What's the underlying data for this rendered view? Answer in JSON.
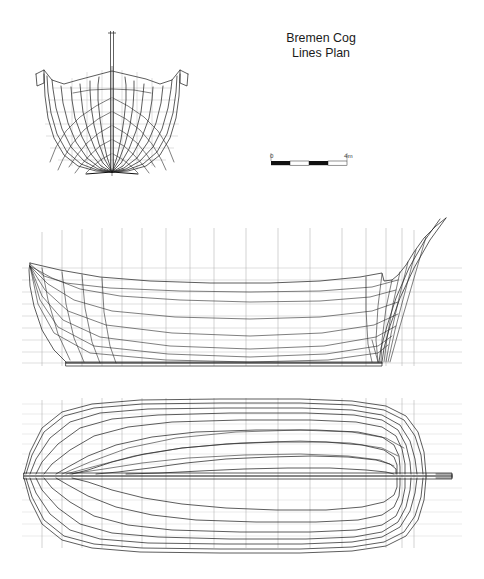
{
  "document": {
    "title_line1": "Bremen Cog",
    "title_line2": "Lines Plan",
    "background_color": "#ffffff",
    "ink_color": "#1d1d1d",
    "grid_color": "#b9b9b9"
  },
  "scale_bar": {
    "label_start": "0",
    "label_end": "4m",
    "segments": 4,
    "segment_colors": [
      "#111111",
      "#ffffff",
      "#111111",
      "#ffffff"
    ],
    "units": "m",
    "total_length": 4
  },
  "views": [
    {
      "name": "body-plan",
      "label": "Body Plan",
      "description": "Transverse station sections viewed from ahead, half-breadths mirrored about the vertical centreline, with mast on the centreline",
      "station_count": 9,
      "waterline_count": 7
    },
    {
      "name": "sheer-plan",
      "label": "Sheer / Profile Plan",
      "description": "Longitudinal profile showing sheer line, raked stem and sternpost, buttock lines and waterlines",
      "station_count": 17,
      "waterline_count": 9
    },
    {
      "name": "half-breadth-plan",
      "label": "Half-breadth Plan",
      "description": "Plan view with waterline curves mirrored about the centreline, keel rabbet line along the centre",
      "station_count": 17,
      "waterline_count": 8
    }
  ]
}
